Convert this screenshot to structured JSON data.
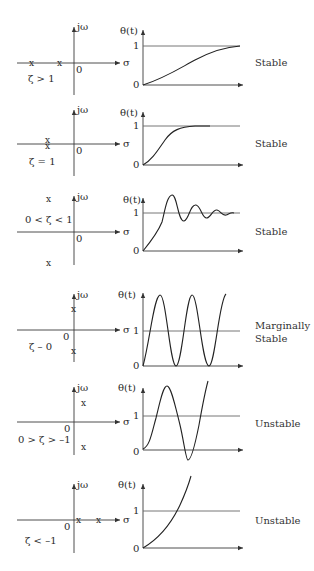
{
  "diagram": {
    "rows": [
      {
        "condition": "ζ > 1",
        "poles": "two distinct real negative poles",
        "response_type": "overdamped",
        "status": "Stable",
        "axis_labels": {
          "imag": "jω",
          "real": "σ",
          "origin": "0",
          "theta": "θ(t)",
          "one": "1",
          "zero": "0"
        },
        "pole_marks": [
          "x",
          "x"
        ]
      },
      {
        "condition": "ζ = 1",
        "poles": "repeated real negative pole",
        "response_type": "critically damped",
        "status": "Stable",
        "axis_labels": {
          "imag": "jω",
          "real": "σ",
          "origin": "0",
          "theta": "θ(t)",
          "one": "1",
          "zero": "0"
        },
        "pole_marks": [
          "x",
          "x"
        ]
      },
      {
        "condition": "0 < ζ < 1",
        "poles": "complex conjugate poles in left half plane",
        "response_type": "underdamped",
        "status": "Stable",
        "axis_labels": {
          "imag": "jω",
          "real": "σ",
          "origin": "0",
          "theta": "θ(t)",
          "one": "1",
          "zero": "0"
        },
        "pole_marks": [
          "x",
          "x"
        ]
      },
      {
        "condition": "ζ – 0",
        "poles": "purely imaginary poles",
        "response_type": "undamped oscillation",
        "status": "Marginally Stable",
        "status_lines": [
          "Marginally",
          "Stable"
        ],
        "axis_labels": {
          "imag": "jω",
          "real": "σ",
          "origin": "0",
          "theta": "θ(t)",
          "one": "1",
          "zero": "0"
        },
        "pole_marks": [
          "x",
          "x"
        ]
      },
      {
        "condition": "0 > ζ > –1",
        "poles": "complex conjugate poles in right half plane",
        "response_type": "growing oscillation",
        "status": "Unstable",
        "axis_labels": {
          "imag": "jω",
          "real": "σ",
          "origin": "0",
          "theta": "θ(t)",
          "one": "1",
          "zero": "0"
        },
        "pole_marks": [
          "x",
          "x"
        ]
      },
      {
        "condition": "ζ < –1",
        "poles": "two distinct real positive poles",
        "response_type": "exponential growth",
        "status": "Unstable",
        "axis_labels": {
          "imag": "jω",
          "real": "σ",
          "origin": "0",
          "theta": "θ(t)",
          "one": "1",
          "zero": "0"
        },
        "pole_marks": [
          "x",
          "x"
        ]
      }
    ]
  }
}
